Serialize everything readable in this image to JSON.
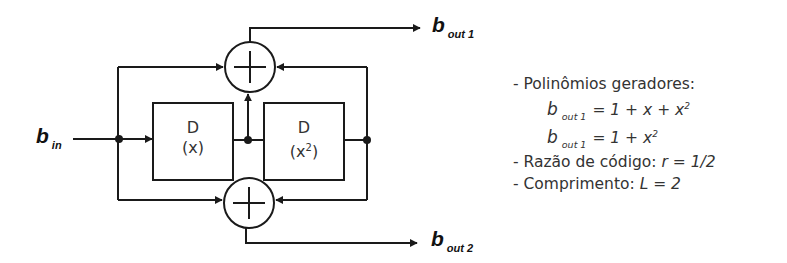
{
  "diagram": {
    "type": "convolutional-encoder",
    "input_label": {
      "symbol": "b",
      "subscript": "in"
    },
    "outputs": [
      {
        "symbol": "b",
        "subscript": "out 1"
      },
      {
        "symbol": "b",
        "subscript": "out 2"
      }
    ],
    "delay_blocks": [
      {
        "label": "D",
        "sublabel": "(x)",
        "sup": ""
      },
      {
        "label": "D",
        "sublabel": "(x",
        "sup": "2",
        "close": ")"
      }
    ],
    "adders": [
      {
        "name": "top-adder",
        "symbol": "+"
      },
      {
        "name": "bottom-adder",
        "symbol": "+"
      }
    ],
    "colors": {
      "line": "#1a1a1a",
      "text": "#333333"
    }
  },
  "notes": {
    "item1_label": "- Polinômios geradores:",
    "poly1": {
      "symbol": "b",
      "subscript": "out 1",
      "eq": "= 1 + x + x",
      "sup": "2"
    },
    "poly2": {
      "symbol": "b",
      "subscript": "out 1",
      "eq": "= 1 + x",
      "sup": "2"
    },
    "item2_label": "- Razão de código: ",
    "item2_value": "r = 1/2",
    "item3_label": "- Comprimento: ",
    "item3_value": "L = 2"
  }
}
